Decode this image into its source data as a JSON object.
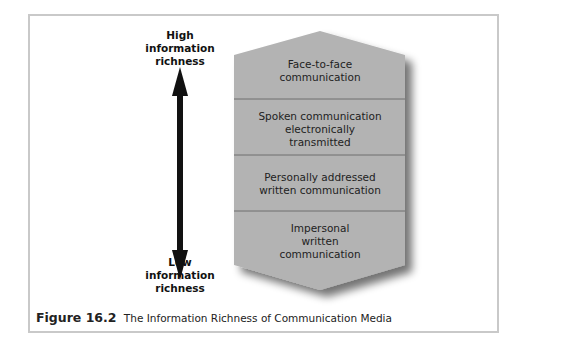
{
  "axis": {
    "top_label": [
      "High",
      "information",
      "richness"
    ],
    "bottom_label": [
      "Low",
      "information",
      "richness"
    ]
  },
  "bands": [
    {
      "lines": [
        "Face-to-face",
        "communication"
      ]
    },
    {
      "lines": [
        "Spoken communication",
        "electronically",
        "transmitted"
      ]
    },
    {
      "lines": [
        "Personally addressed",
        "written communication"
      ]
    },
    {
      "lines": [
        "Impersonal",
        "written",
        "communication"
      ]
    }
  ],
  "caption": {
    "figure_number": "Figure 16.2",
    "title": "The Information Richness of Communication Media"
  },
  "colors": {
    "shape_fill": "#b3b3b3",
    "divider": "#6f6f6f",
    "arrow": "#111111",
    "frame_border": "#c9c9c9"
  }
}
